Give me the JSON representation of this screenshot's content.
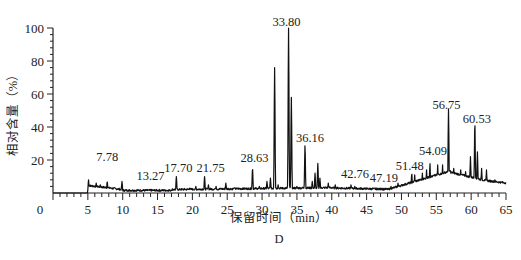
{
  "chart_data": {
    "type": "line",
    "title": "",
    "panel_label": "D",
    "xlabel": "保留时间（min）",
    "ylabel": "相对含量（%）",
    "xlim": [
      0,
      65
    ],
    "ylim": [
      0,
      100
    ],
    "x_ticks": [
      "0",
      "5",
      "10",
      "15",
      "20",
      "25",
      "30",
      "35",
      "40",
      "45",
      "50",
      "55",
      "60",
      "65"
    ],
    "y_ticks": [
      "20",
      "40",
      "60",
      "80",
      "100"
    ],
    "grid": false,
    "legend": null,
    "peaks": [
      {
        "rt": 7.78,
        "label": "7.78",
        "value": 7
      },
      {
        "rt": 13.27,
        "label": "13.27",
        "value": 1.5
      },
      {
        "rt": 17.7,
        "label": "17.70",
        "value": 10
      },
      {
        "rt": 21.75,
        "label": "21.75",
        "value": 10
      },
      {
        "rt": 28.63,
        "label": "28.63",
        "value": 15
      },
      {
        "rt": 31.8,
        "label": "",
        "value": 76
      },
      {
        "rt": 33.8,
        "label": "33.80",
        "value": 100
      },
      {
        "rt": 34.2,
        "label": "",
        "value": 58
      },
      {
        "rt": 36.16,
        "label": "36.16",
        "value": 29
      },
      {
        "rt": 38.0,
        "label": "",
        "value": 18
      },
      {
        "rt": 42.76,
        "label": "42.76",
        "value": 5
      },
      {
        "rt": 47.19,
        "label": "47.19",
        "value": 3
      },
      {
        "rt": 51.48,
        "label": "51.48",
        "value": 12
      },
      {
        "rt": 54.09,
        "label": "54.09",
        "value": 18
      },
      {
        "rt": 56.75,
        "label": "56.75",
        "value": 51
      },
      {
        "rt": 60.53,
        "label": "60.53",
        "value": 43
      }
    ]
  }
}
